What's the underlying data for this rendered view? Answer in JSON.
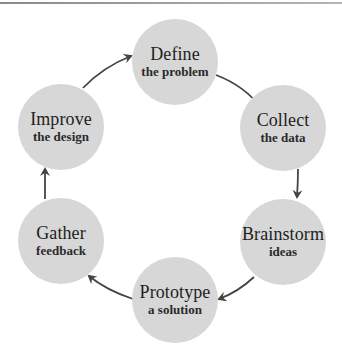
{
  "diagram": {
    "type": "cycle",
    "colors": {
      "node_fill": "#d7d7d7",
      "arrow": "#444444",
      "text": "#1e1e1e"
    },
    "nodes": [
      {
        "id": "define",
        "title": "Define",
        "subtitle": "the problem"
      },
      {
        "id": "collect",
        "title": "Collect",
        "subtitle": "the data"
      },
      {
        "id": "brainstorm",
        "title": "Brainstorm",
        "subtitle": "ideas"
      },
      {
        "id": "prototype",
        "title": "Prototype",
        "subtitle": "a solution"
      },
      {
        "id": "gather",
        "title": "Gather",
        "subtitle": "feedback"
      },
      {
        "id": "improve",
        "title": "Improve",
        "subtitle": "the design"
      }
    ],
    "edges": [
      {
        "from": "define",
        "to": "collect"
      },
      {
        "from": "collect",
        "to": "brainstorm"
      },
      {
        "from": "brainstorm",
        "to": "prototype"
      },
      {
        "from": "prototype",
        "to": "gather"
      },
      {
        "from": "gather",
        "to": "improve"
      },
      {
        "from": "improve",
        "to": "define"
      }
    ]
  }
}
